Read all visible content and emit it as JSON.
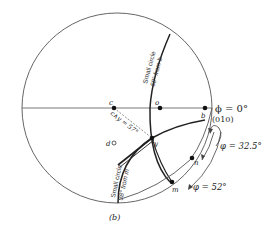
{
  "figure": {
    "caption": "(b)",
    "points": {
      "c": "c",
      "o": "o",
      "b": "b",
      "y": "y",
      "m": "m",
      "n": "n",
      "d": "d"
    },
    "labels": {
      "phi_zero": "ϕ = 0°",
      "plane_010": "(010)",
      "small_circle_b_line1": "Small circle",
      "small_circle_b_line2": "50° from b",
      "small_circle_m_line1": "Small circle",
      "small_circle_m_line2": "38° from m",
      "cy_angle": "c∧y = 57°",
      "phi_32": "φ = 32.5°",
      "phi_52": "φ = 52°"
    },
    "colors": {
      "ink": "#222222",
      "thin": "#555555",
      "dashed": "#777777"
    }
  }
}
